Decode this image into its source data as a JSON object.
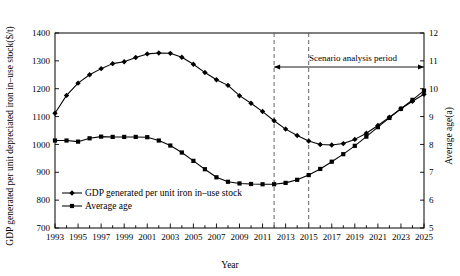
{
  "chart_data": {
    "type": "line",
    "title": "",
    "xlabel": "Year",
    "ylabel": "GDP generated per unit depreciated iron in–use stock($/t)",
    "y2label": "Average age(a)",
    "x": [
      1993,
      1994,
      1995,
      1996,
      1997,
      1998,
      1999,
      2000,
      2001,
      2002,
      2003,
      2004,
      2005,
      2006,
      2007,
      2008,
      2009,
      2010,
      2011,
      2012,
      2013,
      2014,
      2015,
      2016,
      2017,
      2018,
      2019,
      2020,
      2021,
      2022,
      2023,
      2024,
      2025
    ],
    "xlim": [
      1993,
      2025
    ],
    "xticks": [
      1993,
      1995,
      1997,
      1999,
      2001,
      2003,
      2005,
      2007,
      2009,
      2011,
      2013,
      2015,
      2017,
      2019,
      2021,
      2023,
      2025
    ],
    "xtick_labels": [
      "1993",
      "1995",
      "1997",
      "1999",
      "2001",
      "2003",
      "2005",
      "2007",
      "2009",
      "2011",
      "2013",
      "2015",
      "2017",
      "2019",
      "2021",
      "2023",
      "2025"
    ],
    "ylim": [
      700,
      1400
    ],
    "yticks": [
      700,
      800,
      900,
      1000,
      1100,
      1200,
      1300,
      1400
    ],
    "ytick_labels": [
      "700",
      "800",
      "900",
      "1000",
      "1100",
      "1200",
      "1300",
      "1400"
    ],
    "y2lim": [
      5,
      12
    ],
    "y2ticks": [
      5,
      6,
      7,
      8,
      9,
      10,
      11,
      12
    ],
    "y2tick_labels": [
      "5",
      "6",
      "7",
      "8",
      "9",
      "10",
      "11",
      "12"
    ],
    "grid": false,
    "legend_position": "lower-left",
    "series": [
      {
        "name": "GDP generated per unit iron in–use stock",
        "axis": "left",
        "marker": "diamond",
        "values": [
          1112,
          1176,
          1220,
          1250,
          1272,
          1290,
          1297,
          1312,
          1325,
          1328,
          1327,
          1313,
          1288,
          1258,
          1232,
          1212,
          1175,
          1148,
          1118,
          1085,
          1055,
          1032,
          1012,
          1000,
          998,
          1003,
          1018,
          1040,
          1068,
          1098,
          1128,
          1155,
          1180
        ]
      },
      {
        "name": "Average age",
        "axis": "left",
        "marker": "square",
        "values": [
          1014,
          1014,
          1010,
          1022,
          1028,
          1027,
          1027,
          1027,
          1026,
          1014,
          996,
          971,
          941,
          911,
          882,
          866,
          860,
          858,
          857,
          857,
          862,
          873,
          890,
          912,
          938,
          965,
          995,
          1028,
          1062,
          1095,
          1128,
          1160,
          1193
        ]
      }
    ],
    "annotations": [
      {
        "name": "scenario-analysis-period",
        "text": "Scenario analysis period",
        "x_start": 2012,
        "x_end": 2025
      }
    ],
    "reference_lines": [
      {
        "name": "dashed-2012",
        "x": 2012
      },
      {
        "name": "dashed-2015",
        "x": 2015
      }
    ]
  },
  "legend": {
    "items": [
      {
        "label": "GDP generated per unit iron in–use stock",
        "marker": "diamond"
      },
      {
        "label": "Average age",
        "marker": "square"
      }
    ]
  },
  "colors": {
    "ink": "#000000",
    "dashed": "#555555",
    "background": "#ffffff"
  }
}
